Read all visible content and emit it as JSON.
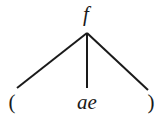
{
  "diagram": {
    "type": "parse-tree",
    "root": {
      "label": "f",
      "x": 86,
      "y": 4
    },
    "apex": {
      "x": 87,
      "y": 33
    },
    "children": [
      {
        "label": "(",
        "x": 12,
        "y": 92,
        "line_end": {
          "x": 17,
          "y": 88
        }
      },
      {
        "label": "ae",
        "x": 87,
        "y": 92,
        "line_end": {
          "x": 87,
          "y": 88
        }
      },
      {
        "label": ")",
        "x": 151,
        "y": 92,
        "line_end": {
          "x": 148,
          "y": 90
        }
      }
    ],
    "stroke_color": "#1a1a1a"
  }
}
